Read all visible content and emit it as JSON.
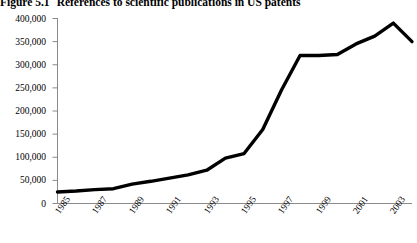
{
  "title": {
    "number": "Figure 5.1",
    "text": "References to scientific publications in US patents",
    "full": "Figure 5.1  References to scientific publications in US patents"
  },
  "chart_data": {
    "type": "line",
    "title": "References to scientific publications in US patents",
    "xlabel": "",
    "ylabel": "",
    "x": [
      1985,
      1986,
      1987,
      1988,
      1989,
      1990,
      1991,
      1992,
      1993,
      1994,
      1995,
      1996,
      1997,
      1998,
      1999,
      2000,
      2001,
      2002,
      2003,
      2004
    ],
    "categories": [
      "1985",
      "1986",
      "1987",
      "1988",
      "1989",
      "1990",
      "1991",
      "1992",
      "1993",
      "1994",
      "1995",
      "1996",
      "1997",
      "1998",
      "1999",
      "2000",
      "2001",
      "2002",
      "2003",
      "2004"
    ],
    "values": [
      25000,
      27000,
      30000,
      32000,
      42000,
      48000,
      55000,
      62000,
      72000,
      98000,
      108000,
      160000,
      245000,
      320000,
      320000,
      322000,
      345000,
      362000,
      390000,
      350000
    ],
    "series": [
      {
        "name": "References to scientific publications in US patents",
        "values": [
          25000,
          27000,
          30000,
          32000,
          42000,
          48000,
          55000,
          62000,
          72000,
          98000,
          108000,
          160000,
          245000,
          320000,
          320000,
          322000,
          345000,
          362000,
          390000,
          350000
        ],
        "color": "#000000"
      }
    ],
    "xlim": [
      1985,
      2004
    ],
    "ylim": [
      0,
      400000
    ],
    "yticks": [
      0,
      50000,
      100000,
      150000,
      200000,
      250000,
      300000,
      350000,
      400000
    ],
    "ytick_labels": [
      "0",
      "50,000",
      "100,000",
      "150,000",
      "200,000",
      "250,000",
      "300,000",
      "350,000",
      "400,000"
    ],
    "xticks": [
      1985,
      1987,
      1989,
      1991,
      1993,
      1995,
      1997,
      1999,
      2001,
      2003
    ],
    "xtick_labels": [
      "1985",
      "1987",
      "1989",
      "1991",
      "1993",
      "1995",
      "1997",
      "1999",
      "2001",
      "2003"
    ],
    "grid": false,
    "legend": "none",
    "line_color": "#000000",
    "line_width": 3.4,
    "axis_color": "#808080"
  }
}
